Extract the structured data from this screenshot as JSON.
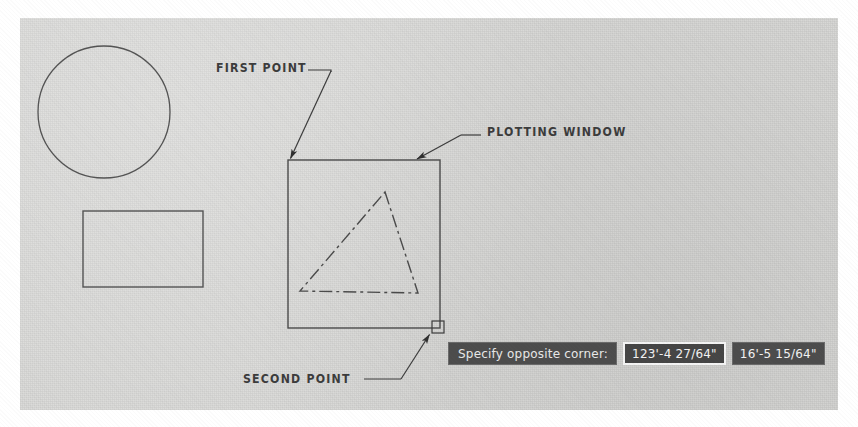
{
  "canvas": {
    "width": 858,
    "height": 427
  },
  "paper": {
    "background_color": "#d8d8d6",
    "border_color": "#ffffff"
  },
  "annotations": [
    {
      "id": "first-point",
      "label": "FIRST POINT",
      "x": 216,
      "y": 62
    },
    {
      "id": "plotting-window",
      "label": "PLOTTING WINDOW",
      "x": 487,
      "y": 126
    },
    {
      "id": "second-point",
      "label": "SECOND POINT",
      "x": 243,
      "y": 373
    }
  ],
  "drawing": {
    "line_color": "#4a4a4a",
    "entities": [
      {
        "name": "circle",
        "type": "circle",
        "cx": 104,
        "cy": 112,
        "r": 66
      },
      {
        "name": "rectangle",
        "type": "rect",
        "x": 83,
        "y": 211,
        "width": 120,
        "height": 76
      },
      {
        "name": "triangle",
        "type": "polygon",
        "linetype": "dash-dot",
        "points": "385,192 418,293 300,291"
      },
      {
        "name": "selection-window",
        "type": "rect",
        "x": 288,
        "y": 160,
        "width": 152,
        "height": 168
      },
      {
        "name": "pick-box-cursor",
        "type": "rect",
        "x": 432,
        "y": 321,
        "width": 12,
        "height": 12
      }
    ]
  },
  "dynamic_input": {
    "prompt": "Specify opposite corner:",
    "fields": [
      {
        "name": "distance-x-field",
        "value": "123'-4 27/64\"",
        "active": true
      },
      {
        "name": "distance-y-field",
        "value": "16'-5 15/64\"",
        "active": false
      }
    ],
    "background_color": "#4c4c4c",
    "text_color": "#e8e8e8",
    "active_border_color": "#f4f4f4"
  }
}
